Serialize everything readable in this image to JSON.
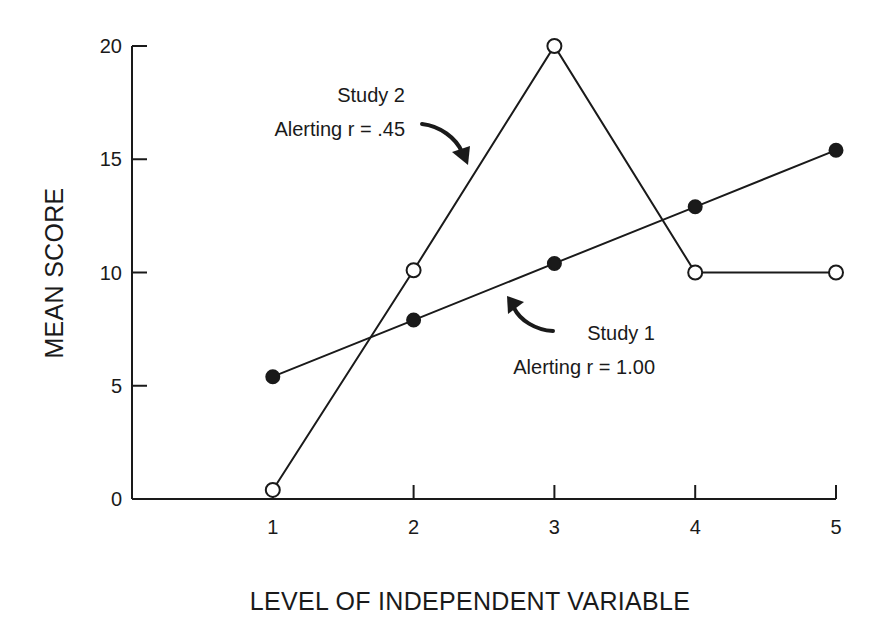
{
  "chart_data": {
    "type": "line",
    "title": "",
    "xlabel": "LEVEL OF INDEPENDENT VARIABLE",
    "ylabel": "MEAN SCORE",
    "x": [
      1,
      2,
      3,
      4,
      5
    ],
    "xticks": [
      "1",
      "2",
      "3",
      "4",
      "5"
    ],
    "yticks": [
      "0",
      "5",
      "10",
      "15",
      "20"
    ],
    "ylim": [
      0,
      20
    ],
    "xlim": [
      0,
      5
    ],
    "grid": false,
    "legend": null,
    "series": [
      {
        "name": "Study 1",
        "marker": "filled-circle",
        "values": [
          5.4,
          7.9,
          10.4,
          12.9,
          15.4
        ]
      },
      {
        "name": "Study 2",
        "marker": "open-circle",
        "values": [
          0.4,
          10.1,
          20,
          10,
          10
        ]
      }
    ],
    "annotations": [
      {
        "series": "Study 2",
        "line1": "Study 2",
        "line2": "Alerting r = .45"
      },
      {
        "series": "Study 1",
        "line1": "Study 1",
        "line2": "Alerting r = 1.00"
      }
    ]
  },
  "colors": {
    "ink": "#1a1a1a",
    "background": "#ffffff"
  }
}
